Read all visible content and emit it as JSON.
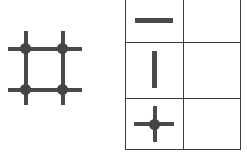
{
  "figure": {
    "title": "",
    "background_color": "#ffffff",
    "stroke_color": "#4a4a4a",
    "node_color": "#444444",
    "border_color": "#3b3b3b"
  },
  "lattice": {
    "name": "square lattice fragment",
    "description": "2 by 2 grid of crossing lines with four marked intersection nodes",
    "rows": 2,
    "columns": 2,
    "node_count": 4,
    "nodes": [
      {
        "label": "",
        "row": 1,
        "column": 1
      },
      {
        "label": "",
        "row": 1,
        "column": 2
      },
      {
        "label": "",
        "row": 2,
        "column": 1
      },
      {
        "label": "",
        "row": 2,
        "column": 2
      }
    ],
    "horizontal_lines": 2,
    "vertical_lines": 2
  },
  "table": {
    "name": "symbol legend table",
    "row_count": 3,
    "column_count": 2,
    "headers": [
      "",
      ""
    ],
    "rows": [
      {
        "symbol_name": "horizontal-line-icon",
        "symbol_label": "",
        "value": ""
      },
      {
        "symbol_name": "vertical-line-icon",
        "symbol_label": "",
        "value": ""
      },
      {
        "symbol_name": "cross-with-node-icon",
        "symbol_label": "",
        "value": ""
      }
    ]
  }
}
